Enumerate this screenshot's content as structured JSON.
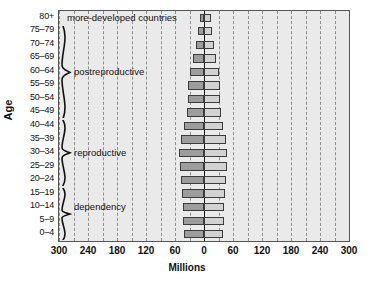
{
  "chart_data": {
    "type": "bar",
    "subtype": "population-pyramid",
    "title": "",
    "xlabel": "Millions",
    "ylabel": "Age",
    "categories": [
      "0–4",
      "5–9",
      "10–14",
      "15–19",
      "20–24",
      "25–29",
      "30–34",
      "35–39",
      "40–44",
      "45–49",
      "50–54",
      "55–59",
      "60–64",
      "65–69",
      "70–74",
      "75–79",
      "80+"
    ],
    "series": [
      {
        "name": "male",
        "side": "left",
        "color": "#9d9d9d",
        "values": [
          42,
          43,
          44,
          45,
          47,
          49,
          51,
          47,
          41,
          35,
          33,
          33,
          30,
          22,
          16,
          12,
          8
        ]
      },
      {
        "name": "female",
        "side": "right",
        "color": "#d2d2d2",
        "values": [
          40,
          41,
          42,
          43,
          45,
          47,
          48,
          45,
          40,
          35,
          33,
          33,
          31,
          25,
          20,
          17,
          14
        ]
      }
    ],
    "xlim": [
      -300,
      300
    ],
    "xticks": [
      300,
      240,
      180,
      120,
      60,
      0,
      60,
      120,
      180,
      240,
      300
    ],
    "gridline_interval": 30,
    "grid": true,
    "legend": "none",
    "annotations": [
      {
        "text": "more-developed countries",
        "position": "top-left-inside"
      },
      {
        "text": "postreproductive",
        "position": "left-inside",
        "bracket_range": [
          "45–49",
          "80+"
        ]
      },
      {
        "text": "reproductive",
        "position": "left-inside",
        "bracket_range": [
          "15–19",
          "40–44"
        ]
      },
      {
        "text": "dependency",
        "position": "left-inside",
        "bracket_range": [
          "0–4",
          "15–19"
        ]
      }
    ]
  },
  "axes": {
    "y_title": "Age",
    "x_title": "Millions",
    "x_tick_labels": [
      "300",
      "240",
      "180",
      "120",
      "60",
      "0",
      "60",
      "120",
      "180",
      "240",
      "300"
    ],
    "age_labels": [
      "80+",
      "75–79",
      "70–74",
      "65–69",
      "60–64",
      "55–59",
      "50–54",
      "45–49",
      "40–44",
      "35–39",
      "30–34",
      "25–29",
      "20–24",
      "15–19",
      "10–14",
      "5–9",
      "0–4"
    ]
  },
  "annotations": {
    "title_note": "more-developed countries",
    "group_postreproductive": "postreproductive",
    "group_reproductive": "reproductive",
    "group_dependency": "dependency"
  },
  "colors": {
    "plot_background": "#eaeaea",
    "male_bar": "#9d9d9d",
    "female_bar": "#d2d2d2",
    "gridline": "#8d8d8d",
    "axis": "#1a1a1a",
    "text": "#111111"
  }
}
